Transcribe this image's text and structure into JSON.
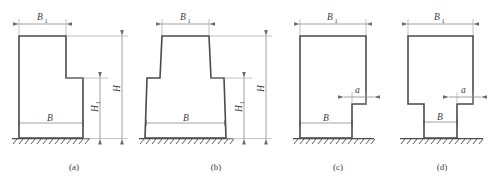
{
  "figure": {
    "background_color": "#ffffff",
    "outline_color": "#4a4a4a",
    "dimension_color": "#8a8a8a",
    "panels": [
      {
        "id": "a",
        "caption": "(a)",
        "description": "L-shaped stepped section, step on right side",
        "labels": {
          "top_width": "B",
          "top_width_sub": "1",
          "base_width": "B",
          "total_height": "H",
          "lower_height": "H",
          "lower_height_sub": "1"
        }
      },
      {
        "id": "b",
        "caption": "(b)",
        "description": "Symmetric stepped section with tapered stem",
        "labels": {
          "top_width": "B",
          "top_width_sub": "1",
          "base_width": "B",
          "total_height": "H",
          "lower_height": "H",
          "lower_height_sub": "1"
        }
      },
      {
        "id": "c",
        "caption": "(c)",
        "description": "Rectangular section with single-sided bottom notch",
        "labels": {
          "top_width": "B",
          "top_width_sub": "1",
          "base_width": "B",
          "notch_width": "a"
        }
      },
      {
        "id": "d",
        "caption": "(d)",
        "description": "Rectangular section with symmetric bottom notches",
        "labels": {
          "top_width": "B",
          "top_width_sub": "1",
          "base_width": "B",
          "notch_width": "a"
        }
      }
    ]
  }
}
